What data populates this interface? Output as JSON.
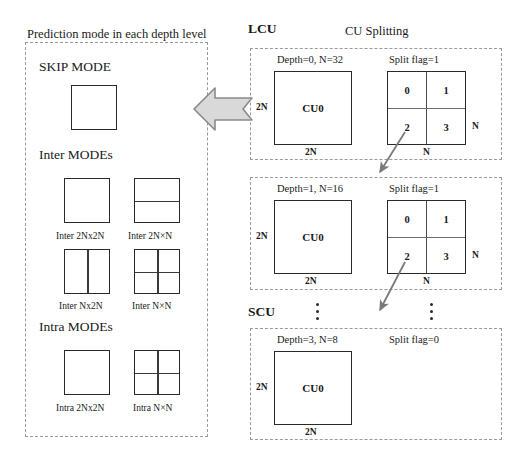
{
  "figure": {
    "left_panel": {
      "caption": "Prediction mode in each depth level",
      "groups": [
        {
          "heading": "SKIP MODE",
          "modes": [
            {
              "label": "",
              "partition": "2Nx2N"
            }
          ]
        },
        {
          "heading": "Inter MODEs",
          "modes": [
            {
              "label": "Inter 2Nx2N",
              "partition": "2Nx2N"
            },
            {
              "label": "Inter 2N×N",
              "partition": "2NxN"
            },
            {
              "label": "Inter Nx2N",
              "partition": "Nx2N"
            },
            {
              "label": "Inter N×N",
              "partition": "NxN"
            }
          ]
        },
        {
          "heading": "Intra MODEs",
          "modes": [
            {
              "label": "Intra 2Nx2N",
              "partition": "2Nx2N"
            },
            {
              "label": "Intra N×N",
              "partition": "NxN"
            }
          ]
        }
      ]
    },
    "right_panel": {
      "lcu_label": "LCU",
      "scu_label": "SCU",
      "splitting_title": "CU Splitting",
      "blocks": [
        {
          "depth_text": "Depth=0, N=32",
          "split_flag_text": "Split flag=1",
          "cu_label": "CU0",
          "left_dim": "2N",
          "bottom_dim": "2N",
          "split_right_dim": "N",
          "split_bottom_dim": "N",
          "quadrants": [
            "0",
            "1",
            "2",
            "3"
          ],
          "has_split": true
        },
        {
          "depth_text": "Depth=1, N=16",
          "split_flag_text": "Split flag=1",
          "cu_label": "CU0",
          "left_dim": "2N",
          "bottom_dim": "2N",
          "split_right_dim": "N",
          "split_bottom_dim": "N",
          "quadrants": [
            "0",
            "1",
            "2",
            "3"
          ],
          "has_split": true
        },
        {
          "depth_text": "Depth=3, N=8",
          "split_flag_text": "Split flag=0",
          "cu_label": "CU0",
          "left_dim": "2N",
          "bottom_dim": "2N",
          "split_right_dim": "",
          "split_bottom_dim": "",
          "quadrants": [],
          "has_split": false
        }
      ]
    },
    "colors": {
      "arrow_fill": "#d9d9d9",
      "arrow_stroke": "#8a8a8a",
      "dashed_border": "#9a9a9a",
      "square_border": "#2a2a2a",
      "diagonal_arrow": "#7a7a7a"
    }
  }
}
